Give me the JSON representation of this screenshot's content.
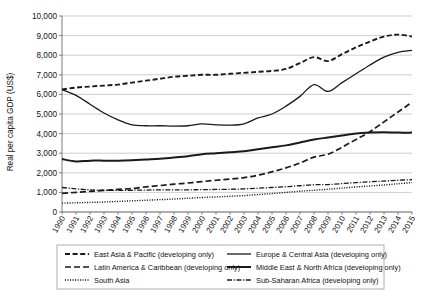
{
  "chart_data": {
    "type": "line",
    "title": "",
    "xlabel": "",
    "ylabel": "Real per capita GDP (US$)",
    "ylim": [
      0,
      10000
    ],
    "ytick_labels": [
      "10,000",
      "9,000",
      "8,000",
      "7,000",
      "6,000",
      "5,000",
      "4,000",
      "3,000",
      "2,000",
      "1,000",
      "0"
    ],
    "ytick_values": [
      10000,
      9000,
      8000,
      7000,
      6000,
      5000,
      4000,
      3000,
      2000,
      1000,
      0
    ],
    "grid": true,
    "legend_position": "bottom",
    "x": [
      1990,
      1991,
      1992,
      1993,
      1994,
      1995,
      1996,
      1997,
      1998,
      1999,
      2000,
      2001,
      2002,
      2003,
      2004,
      2005,
      2006,
      2007,
      2008,
      2009,
      2010,
      2011,
      2012,
      2013,
      2014,
      2015
    ],
    "categories": [
      "1990",
      "1991",
      "1992",
      "1993",
      "1994",
      "1995",
      "1996",
      "1997",
      "1998",
      "1999",
      "2000",
      "2001",
      "2002",
      "2003",
      "2004",
      "2005",
      "2006",
      "2007",
      "2008",
      "2009",
      "2010",
      "2011",
      "2012",
      "2013",
      "2014",
      "2015"
    ],
    "series": [
      {
        "name": "East Asia & Pacific (developing only)",
        "style": "dashed",
        "values": [
          6250,
          6350,
          6400,
          6450,
          6500,
          6600,
          6700,
          6800,
          6900,
          6950,
          7000,
          7000,
          7050,
          7100,
          7150,
          7200,
          7300,
          7600,
          7900,
          7700,
          8050,
          8400,
          8700,
          8950,
          9050,
          8950
        ]
      },
      {
        "name": "Europe & Central Asia (developing only)",
        "style": "solid",
        "values": [
          6250,
          5950,
          5500,
          5050,
          4700,
          4450,
          4400,
          4400,
          4380,
          4400,
          4500,
          4450,
          4430,
          4500,
          4800,
          5000,
          5400,
          5900,
          6500,
          6150,
          6600,
          7050,
          7500,
          7900,
          8150,
          8250
        ]
      },
      {
        "name": "Latin America & Caribbean (developing only)",
        "style": "dashed-wide",
        "values": [
          950,
          1000,
          1050,
          1100,
          1150,
          1200,
          1280,
          1350,
          1420,
          1480,
          1550,
          1620,
          1680,
          1750,
          1880,
          2050,
          2250,
          2500,
          2800,
          2950,
          3300,
          3700,
          4100,
          4600,
          5100,
          5600
        ]
      },
      {
        "name": "Middle East & North Africa (developing only)",
        "style": "solid-thick",
        "values": [
          2700,
          2580,
          2620,
          2620,
          2620,
          2640,
          2680,
          2720,
          2780,
          2850,
          2950,
          3000,
          3050,
          3100,
          3200,
          3300,
          3400,
          3550,
          3700,
          3800,
          3900,
          4000,
          4050,
          4070,
          4050,
          4050
        ]
      },
      {
        "name": "South Asia",
        "style": "dotted",
        "values": [
          450,
          470,
          490,
          510,
          540,
          570,
          600,
          630,
          660,
          700,
          740,
          770,
          800,
          840,
          890,
          940,
          1000,
          1060,
          1110,
          1160,
          1220,
          1280,
          1330,
          1380,
          1440,
          1500
        ]
      },
      {
        "name": "Sub-Saharan Africa (developing only)",
        "style": "dash-dot",
        "values": [
          1250,
          1180,
          1130,
          1110,
          1100,
          1110,
          1120,
          1130,
          1130,
          1130,
          1140,
          1150,
          1160,
          1180,
          1210,
          1250,
          1290,
          1340,
          1390,
          1400,
          1450,
          1500,
          1540,
          1580,
          1620,
          1650
        ]
      }
    ]
  },
  "legend": {
    "entries": [
      {
        "label": "East Asia & Pacific (developing only)"
      },
      {
        "label": "Europe & Central Asia (developing only)"
      },
      {
        "label": "Latin America & Caribbean (developing only)"
      },
      {
        "label": "Middle East & North Africa (developing only)"
      },
      {
        "label": "South Asia"
      },
      {
        "label": "Sub-Saharan Africa (developing only)"
      }
    ]
  },
  "colors": {
    "line": "#1a1a1a",
    "grid": "#b9b9b9",
    "axis": "#6e6e6e",
    "legend_border": "#9a9a9a",
    "text": "#111111",
    "background": "#ffffff"
  }
}
